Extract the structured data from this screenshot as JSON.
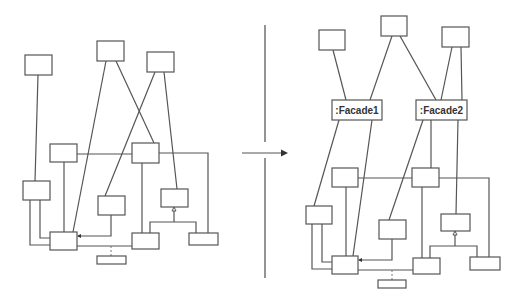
{
  "figure": {
    "arrow_icon": "right-arrow",
    "colors": {
      "line": "#555555",
      "background": "#ffffff",
      "label": "#333333"
    }
  },
  "left_diagram": {
    "title": "",
    "boxes": [
      {
        "id": "A",
        "label": ""
      },
      {
        "id": "B",
        "label": ""
      },
      {
        "id": "C",
        "label": ""
      },
      {
        "id": "D",
        "label": ""
      },
      {
        "id": "E",
        "label": ""
      },
      {
        "id": "F",
        "label": ""
      },
      {
        "id": "G",
        "label": ""
      },
      {
        "id": "H",
        "label": ""
      },
      {
        "id": "I",
        "label": ""
      },
      {
        "id": "J",
        "label": ""
      },
      {
        "id": "K",
        "label": ""
      },
      {
        "id": "L",
        "label": ""
      }
    ]
  },
  "right_diagram": {
    "facades": [
      {
        "id": "F1",
        "label": ":Facade1"
      },
      {
        "id": "F2",
        "label": ":Facade2"
      }
    ]
  }
}
